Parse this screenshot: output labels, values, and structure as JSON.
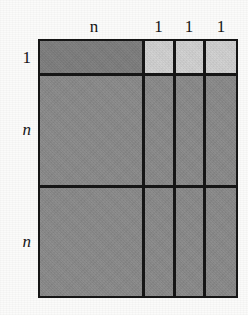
{
  "figure": {
    "kind": "block-matrix-partition-diagram",
    "background_color": "#fbfbfa",
    "line_color": "#161616",
    "fill_dark": "#8a8a8a",
    "fill_darker": "#7e7e7e",
    "fill_light": "#d2d2d2"
  },
  "column_labels": [
    {
      "text": "n",
      "style": "italic"
    },
    {
      "text": "1",
      "style": "upright"
    },
    {
      "text": "1",
      "style": "upright"
    },
    {
      "text": "1",
      "style": "upright"
    }
  ],
  "row_labels": [
    {
      "text": "1",
      "style": "upright"
    },
    {
      "text": "n",
      "style": "italic"
    },
    {
      "text": "n",
      "style": "italic"
    }
  ],
  "blocks": [
    {
      "row": 0,
      "col": 0,
      "shade": "darker"
    },
    {
      "row": 0,
      "col": 1,
      "shade": "light"
    },
    {
      "row": 0,
      "col": 2,
      "shade": "light"
    },
    {
      "row": 0,
      "col": 3,
      "shade": "light"
    },
    {
      "row": 1,
      "col": 0,
      "shade": "dark"
    },
    {
      "row": 1,
      "col": 1,
      "shade": "dark"
    },
    {
      "row": 1,
      "col": 2,
      "shade": "dark"
    },
    {
      "row": 1,
      "col": 3,
      "shade": "dark"
    },
    {
      "row": 2,
      "col": 0,
      "shade": "dark"
    },
    {
      "row": 2,
      "col": 1,
      "shade": "dark"
    },
    {
      "row": 2,
      "col": 2,
      "shade": "dark"
    },
    {
      "row": 2,
      "col": 3,
      "shade": "dark"
    }
  ]
}
